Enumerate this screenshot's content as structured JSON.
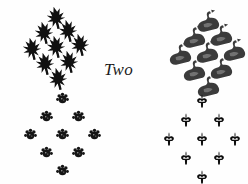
{
  "figure": {
    "width": 248,
    "height": 184,
    "background_color": "#fefefe",
    "center_label": "Two"
  },
  "clusters": [
    {
      "id": "top-left",
      "name": "cluster-top-left",
      "motif_name": "angular-leaf-icon",
      "count": 9,
      "arrangement": "diamond",
      "rows": [
        1,
        2,
        3,
        2,
        1
      ],
      "color": "#111111",
      "origin": {
        "x": 14,
        "y": 6
      },
      "size": 24,
      "spacing_x": 22,
      "spacing_y": 17,
      "rotation": -12,
      "positions": [
        {
          "x": 30,
          "y": 0
        },
        {
          "x": 18,
          "y": 15
        },
        {
          "x": 42,
          "y": 13
        },
        {
          "x": 6,
          "y": 31
        },
        {
          "x": 30,
          "y": 29
        },
        {
          "x": 54,
          "y": 27
        },
        {
          "x": 19,
          "y": 46
        },
        {
          "x": 43,
          "y": 44
        },
        {
          "x": 32,
          "y": 61
        }
      ]
    },
    {
      "id": "top-right",
      "name": "cluster-top-right",
      "motif_name": "swan-icon",
      "count": 9,
      "arrangement": "diamond",
      "rows": [
        1,
        2,
        3,
        2,
        1
      ],
      "color": "#3b3b3b",
      "origin": {
        "x": 160,
        "y": 8
      },
      "size": 26,
      "spacing_x": 24,
      "spacing_y": 18,
      "rotation": -14,
      "positions": [
        {
          "x": 34,
          "y": 0
        },
        {
          "x": 20,
          "y": 16
        },
        {
          "x": 47,
          "y": 14
        },
        {
          "x": 6,
          "y": 33
        },
        {
          "x": 33,
          "y": 31
        },
        {
          "x": 60,
          "y": 29
        },
        {
          "x": 20,
          "y": 49
        },
        {
          "x": 47,
          "y": 47
        },
        {
          "x": 34,
          "y": 65
        }
      ]
    },
    {
      "id": "bottom-left",
      "name": "cluster-bottom-left",
      "motif_name": "paw-blob-icon",
      "count": 9,
      "arrangement": "diamond",
      "rows": [
        1,
        2,
        3,
        2,
        1
      ],
      "color": "#151515",
      "origin": {
        "x": 20,
        "y": 92
      },
      "size": 13,
      "spacing_x": 26,
      "spacing_y": 19,
      "rotation": 0,
      "positions": [
        {
          "x": 36,
          "y": 0
        },
        {
          "x": 20,
          "y": 18
        },
        {
          "x": 52,
          "y": 18
        },
        {
          "x": 4,
          "y": 36
        },
        {
          "x": 36,
          "y": 36
        },
        {
          "x": 68,
          "y": 36
        },
        {
          "x": 20,
          "y": 54
        },
        {
          "x": 52,
          "y": 54
        },
        {
          "x": 36,
          "y": 72
        }
      ]
    },
    {
      "id": "bottom-right",
      "name": "cluster-bottom-right",
      "motif_name": "fleur-de-lis-icon",
      "count": 9,
      "arrangement": "diamond",
      "rows": [
        1,
        2,
        3,
        2,
        1
      ],
      "color": "#0d0d0d",
      "origin": {
        "x": 158,
        "y": 94
      },
      "size": 14,
      "spacing_x": 27,
      "spacing_y": 20,
      "rotation": 0,
      "positions": [
        {
          "x": 37,
          "y": 0
        },
        {
          "x": 21,
          "y": 19
        },
        {
          "x": 54,
          "y": 19
        },
        {
          "x": 4,
          "y": 38
        },
        {
          "x": 37,
          "y": 38
        },
        {
          "x": 70,
          "y": 38
        },
        {
          "x": 21,
          "y": 57
        },
        {
          "x": 54,
          "y": 57
        },
        {
          "x": 37,
          "y": 76
        }
      ]
    }
  ],
  "center_label_position": {
    "x": 104,
    "y": 60
  }
}
